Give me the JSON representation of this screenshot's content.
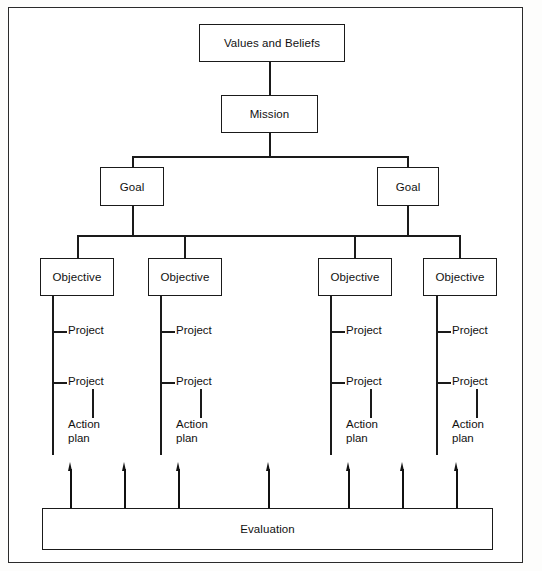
{
  "diagram": {
    "root": {
      "label": "Values and Beliefs"
    },
    "mission": {
      "label": "Mission"
    },
    "goals": [
      {
        "label": "Goal"
      },
      {
        "label": "Goal"
      }
    ],
    "objectives": [
      {
        "label": "Objective",
        "projects": [
          "Project",
          "Project"
        ],
        "action_plan": {
          "line1": "Action",
          "line2": "plan"
        }
      },
      {
        "label": "Objective",
        "projects": [
          "Project",
          "Project"
        ],
        "action_plan": {
          "line1": "Action",
          "line2": "plan"
        }
      },
      {
        "label": "Objective",
        "projects": [
          "Project",
          "Project"
        ],
        "action_plan": {
          "line1": "Action",
          "line2": "plan"
        }
      },
      {
        "label": "Objective",
        "projects": [
          "Project",
          "Project"
        ],
        "action_plan": {
          "line1": "Action",
          "line2": "plan"
        }
      }
    ],
    "evaluation": {
      "label": "Evaluation",
      "feedback_arrow_count": 7
    },
    "colors": {
      "line": "#1a1a1a",
      "box_fill": "#ffffff",
      "text": "#111111",
      "frame": "#2b2b2b",
      "background": "#fdfdfc"
    }
  }
}
